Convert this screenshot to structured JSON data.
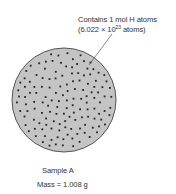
{
  "annotation": {
    "line1": "Contains 1 mol H atoms",
    "line2_prefix": "(6.022 × 10",
    "line2_exponent": "23",
    "line2_suffix": " atoms)"
  },
  "sample": {
    "name": "Sample A",
    "mass": "Mass = 1.008 g"
  },
  "colors": {
    "circle_fill": "#c4c4c4",
    "circle_stroke": "#555555",
    "dot": "#222222",
    "leader_line": "#555555"
  }
}
